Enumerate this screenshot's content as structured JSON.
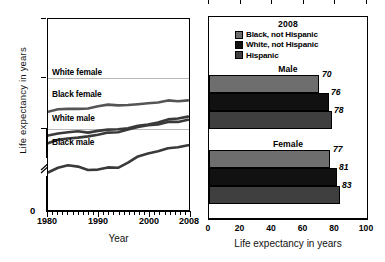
{
  "chart_data": [
    {
      "type": "line",
      "title": "",
      "xlabel": "Year",
      "ylabel": "Life expectancy in years",
      "xlim": [
        1980,
        2008
      ],
      "ylim": [
        0,
        100
      ],
      "y_ticks": [
        "0",
        "60",
        "80",
        "100"
      ],
      "x_ticks": [
        "1980",
        "1990",
        "2000",
        "2008"
      ],
      "grid": true,
      "grid_values": [
        60,
        80
      ],
      "axis_break": true,
      "legend_position": "inline-labels",
      "x": [
        1980,
        1982,
        1984,
        1986,
        1988,
        1990,
        1992,
        1994,
        1996,
        1998,
        2000,
        2002,
        2004,
        2006,
        2008
      ],
      "series": [
        {
          "name": "White female",
          "values": [
            78.1,
            78.7,
            78.8,
            78.8,
            78.9,
            79.4,
            79.8,
            79.6,
            79.7,
            79.9,
            80.1,
            80.3,
            80.8,
            80.6,
            80.8
          ]
        },
        {
          "name": "Black female",
          "values": [
            72.5,
            73.0,
            73.3,
            73.5,
            73.2,
            73.6,
            73.9,
            74.0,
            74.2,
            74.8,
            75.1,
            75.6,
            76.3,
            76.5,
            77.0
          ]
        },
        {
          "name": "White male",
          "values": [
            70.7,
            71.5,
            71.8,
            72.0,
            72.3,
            72.7,
            73.2,
            73.3,
            73.9,
            74.5,
            74.9,
            75.1,
            75.7,
            75.7,
            76.2
          ]
        },
        {
          "name": "Black male",
          "values": [
            63.8,
            64.9,
            65.5,
            65.2,
            64.4,
            64.5,
            65.0,
            64.9,
            66.1,
            67.6,
            68.3,
            68.8,
            69.5,
            69.7,
            70.2
          ]
        }
      ]
    },
    {
      "type": "bar",
      "orientation": "horizontal",
      "title": "2008",
      "xlabel": "Life expectancy in years",
      "ylabel": "",
      "xlim": [
        0,
        100
      ],
      "x_ticks": [
        "0",
        "20",
        "40",
        "60",
        "80",
        "100"
      ],
      "grid": false,
      "legend_position": "top",
      "legend": [
        {
          "label": "Black, not Hispanic",
          "color": "#6e6e6e"
        },
        {
          "label": "White, not Hispanic",
          "color": "#111111"
        },
        {
          "label": "Hispanic",
          "color": "#3f3f3f"
        }
      ],
      "groups": [
        {
          "label": "Male",
          "bars": [
            {
              "category": "Black, not Hispanic",
              "value": 70,
              "value_label": "70"
            },
            {
              "category": "White, not Hispanic",
              "value": 76,
              "value_label": "76"
            },
            {
              "category": "Hispanic",
              "value": 78,
              "value_label": "78"
            }
          ]
        },
        {
          "label": "Female",
          "bars": [
            {
              "category": "Black, not Hispanic",
              "value": 77,
              "value_label": "77"
            },
            {
              "category": "White, not Hispanic",
              "value": 81,
              "value_label": "81"
            },
            {
              "category": "Hispanic",
              "value": 83,
              "value_label": "83"
            }
          ]
        }
      ]
    }
  ],
  "left": {
    "ylabel": "Life expectancy in years",
    "xlabel": "Year",
    "y_ticks": [
      {
        "label": "100",
        "value": 100
      },
      {
        "label": "80",
        "value": 80
      },
      {
        "label": "60",
        "value": 60
      },
      {
        "label": "0",
        "value": 0
      }
    ],
    "x_ticks": [
      {
        "label": "1980",
        "value": 1980
      },
      {
        "label": "1990",
        "value": 1990
      },
      {
        "label": "2000",
        "value": 2000
      },
      {
        "label": "2008",
        "value": 2008
      }
    ],
    "series_tags": [
      {
        "label": "White female"
      },
      {
        "label": "Black female"
      },
      {
        "label": "White male"
      },
      {
        "label": "Black male"
      }
    ]
  },
  "right": {
    "legend_title": "2008",
    "legend": [
      {
        "label": "Black, not Hispanic",
        "color": "#6e6e6e"
      },
      {
        "label": "White, not Hispanic",
        "color": "#111111"
      },
      {
        "label": "Hispanic",
        "color": "#3f3f3f"
      }
    ],
    "group_male": "Male",
    "group_female": "Female",
    "xlabel": "Life expectancy in years",
    "x_ticks": [
      {
        "label": "0",
        "value": 0
      },
      {
        "label": "20",
        "value": 20
      },
      {
        "label": "40",
        "value": 40
      },
      {
        "label": "60",
        "value": 60
      },
      {
        "label": "80",
        "value": 80
      },
      {
        "label": "100",
        "value": 100
      }
    ],
    "values": {
      "male_black": "70",
      "male_white": "76",
      "male_hispanic": "78",
      "female_black": "77",
      "female_white": "81",
      "female_hispanic": "83"
    }
  }
}
